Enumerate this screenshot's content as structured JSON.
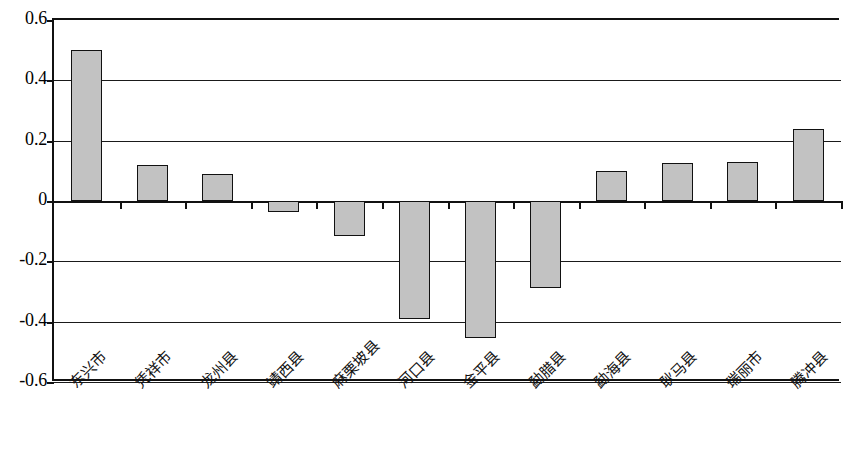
{
  "chart_data": {
    "type": "bar",
    "title": "",
    "subtitle": "",
    "xlabel": "",
    "ylabel": "",
    "ylim": [
      -0.6,
      0.6
    ],
    "ytick_labels": [
      "0.6",
      "0.4",
      "0.2",
      "0",
      "-0.2",
      "-0.4",
      "-0.6"
    ],
    "ytick_values": [
      0.6,
      0.4,
      0.2,
      0,
      -0.2,
      -0.4,
      -0.6
    ],
    "grid": true,
    "legend": "none",
    "orientation": "vertical",
    "bar_fill_color": "#c2c2c2",
    "bar_edge_color": "#111111",
    "categories": [
      "东兴市",
      "凭祥市",
      "龙州县",
      "靖西县",
      "麻栗坡县",
      "河口县",
      "金平县",
      "勐腊县",
      "勐海县",
      "耿马县",
      "瑞丽市",
      "腾冲县"
    ],
    "values": [
      0.5,
      0.12,
      0.09,
      -0.035,
      -0.115,
      -0.39,
      -0.455,
      -0.29,
      0.1,
      0.125,
      0.128,
      0.24
    ],
    "series": [
      {
        "name": "",
        "values": [
          0.5,
          0.12,
          0.09,
          -0.035,
          -0.115,
          -0.39,
          -0.455,
          -0.29,
          0.1,
          0.125,
          0.128,
          0.24
        ]
      }
    ]
  }
}
